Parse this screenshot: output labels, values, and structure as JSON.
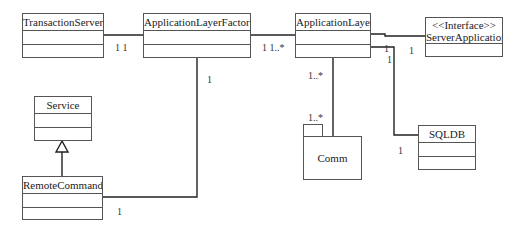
{
  "diagram": {
    "type": "UML class diagram",
    "classes": [
      {
        "id": "transaction-server",
        "name": "TransactionServer"
      },
      {
        "id": "application-layer-factory",
        "name": "ApplicationLayerFactory"
      },
      {
        "id": "application-layer",
        "name": "ApplicationLayer"
      },
      {
        "id": "server-application",
        "stereotype": "<<Interface>>",
        "name": "ServerApplication"
      },
      {
        "id": "service",
        "name": "Service"
      },
      {
        "id": "remote-command",
        "name": "RemoteCommand"
      },
      {
        "id": "sqldb",
        "name": "SQLDB"
      }
    ],
    "packages": [
      {
        "id": "comm",
        "name": "Comm"
      }
    ],
    "associations": [
      {
        "from": "TransactionServer",
        "to": "ApplicationLayerFactory",
        "from_mult": "1",
        "to_mult": "1",
        "label": "1  1"
      },
      {
        "from": "ApplicationLayerFactory",
        "to": "ApplicationLayer",
        "from_mult": "1",
        "to_mult": "1..*",
        "label": "1 1..*"
      },
      {
        "from": "ApplicationLayer",
        "to": "ServerApplication",
        "from_mult": "1",
        "to_mult": "1"
      },
      {
        "from": "ApplicationLayer",
        "to": "SQLDB",
        "from_mult": "1",
        "to_mult": "1"
      },
      {
        "from": "ApplicationLayer",
        "to": "Comm",
        "from_mult": "1..*",
        "to_mult": "1..*"
      },
      {
        "from": "ApplicationLayerFactory",
        "to": "RemoteCommand",
        "from_mult": "1",
        "to_mult": "1"
      }
    ],
    "generalizations": [
      {
        "child": "RemoteCommand",
        "parent": "Service"
      }
    ],
    "multiplicity_labels": {
      "ts_alf": "1  1",
      "alf_al": "1 1..*",
      "al_sa_left": "1",
      "al_sa_right": "1",
      "al_sqldb_top": "1",
      "sqldb_end": "1",
      "al_comm_top": "1..*",
      "comm_end": "1..*",
      "alf_rc_top": "1",
      "rc_end": "1"
    }
  }
}
